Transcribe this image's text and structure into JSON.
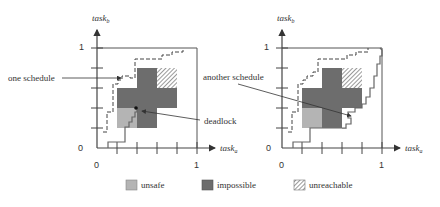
{
  "colors": {
    "impossible": "#6d6d6d",
    "unsafe": "#b4b4b4",
    "unreachable_bg": "#ffffff",
    "hatch": "#555555",
    "axis": "#444444",
    "path": "#666666"
  },
  "left_diagram": {
    "y_axis_label": "task",
    "y_axis_sub": "b",
    "x_axis_label": "task",
    "x_axis_sub": "a",
    "y_one": "1",
    "x_one": "1",
    "origin_y": "0",
    "origin_x": "0",
    "annotation_schedule": "one schedule",
    "annotation_deadlock": "deadlock"
  },
  "right_diagram": {
    "y_axis_label": "task",
    "y_axis_sub": "b",
    "x_axis_label": "task",
    "x_axis_sub": "a",
    "y_one": "1",
    "x_one": "1",
    "origin_y": "0",
    "origin_x": "0",
    "annotation_schedule": "another schedule"
  },
  "legend": {
    "items": [
      {
        "label": "unsafe"
      },
      {
        "label": "impossible"
      },
      {
        "label": "unreachable"
      }
    ]
  }
}
